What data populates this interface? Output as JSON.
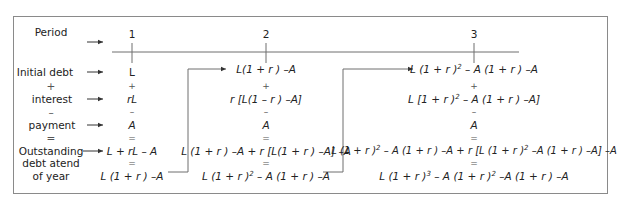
{
  "row_labels": {
    "period": "Period",
    "initial_debt": "Initial debt",
    "plus": "+",
    "interest": "interest",
    "minus": "–",
    "payment": "payment",
    "equals": "=",
    "outstanding_1": "Outstanding",
    "outstanding_2": "debt atend",
    "outstanding_3": "of year"
  },
  "periods": [
    "1",
    "2",
    "3"
  ],
  "columns": [
    {
      "initial_debt": "L",
      "plus": "+",
      "interest": "rL",
      "minus": "–",
      "payment": "A",
      "equals": "=",
      "outstanding_expanded": "L + rL – A",
      "equals2": "=",
      "outstanding_simplified": "L (1 + r ) –A"
    },
    {
      "initial_debt": "L(1 + r ) –A",
      "plus": "+",
      "interest": "r [L(1 – r ) –A]",
      "minus": "–",
      "payment": "A",
      "equals": "=",
      "outstanding_expanded": "L (1 + r ) –A + r [L(1 + r ) –A] –A",
      "equals2": "=",
      "outstanding_simplified_a": "L (1 + r )",
      "outstanding_simplified_exp": "2",
      "outstanding_simplified_b": " – A (1 + r ) –A"
    },
    {
      "initial_debt_a": "L (1 + r )",
      "initial_debt_exp": "2",
      "initial_debt_b": " – A (1 + r ) –A",
      "plus": "+",
      "interest_a": "L [1 + r )",
      "interest_exp": "2",
      "interest_b": " – A (1 + r ) –A]",
      "minus": "–",
      "payment": "A",
      "equals": "=",
      "outstanding_expanded_a": "L (1 + r )",
      "outstanding_expanded_exp": "2",
      "outstanding_expanded_b": " – A (1 + r ) –A + r [L (1 + r )",
      "outstanding_expanded_exp2": "2",
      "outstanding_expanded_c": " –A (1 + r ) –A] –A",
      "equals2": "=",
      "outstanding_simplified_a": "L (1 + r )",
      "outstanding_simplified_exp": "3",
      "outstanding_simplified_b": " – A (1 + r )",
      "outstanding_simplified_exp2": "2",
      "outstanding_simplified_c": " –A (1 + r ) –A"
    }
  ],
  "colors": {
    "line": "#6e6e6e",
    "frame": "#8a8a8a",
    "text": "#222222"
  }
}
